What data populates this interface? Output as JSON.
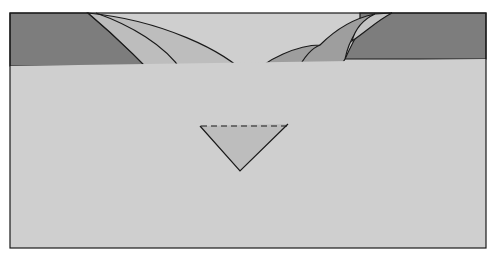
{
  "diagram": {
    "title": "",
    "colors": {
      "background": "#ffffff",
      "frame_fill": "#cfcfcf",
      "dark_band": "#7d7d7d",
      "mid_layer": "#9e9e9e",
      "light_layer": "#bdbdbd",
      "lighter_layer": "#c4c4c4",
      "outline": "#1a1a1a"
    },
    "labels": []
  }
}
